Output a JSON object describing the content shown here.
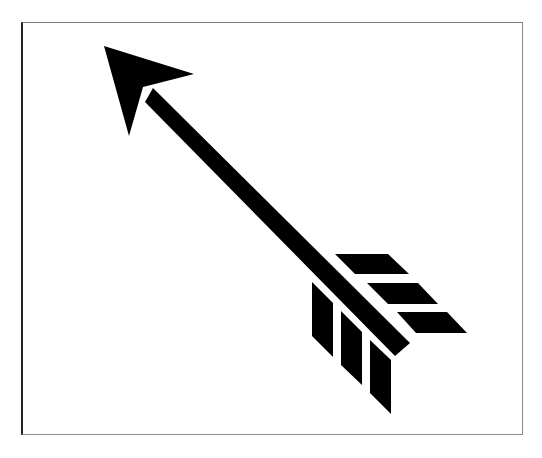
{
  "image": {
    "subject": "arrow",
    "description": "Black silhouette of an arrow pointing up-left with three-pronged fletching on each side",
    "background_color": "#ffffff",
    "fill_color": "#000000",
    "frame_color": "#7a7a7a"
  },
  "arrow": {
    "head": [
      [
        104,
        46
      ],
      [
        194,
        74
      ],
      [
        143,
        87
      ],
      [
        129,
        136
      ]
    ],
    "shaft": [
      [
        153,
        88
      ],
      [
        145,
        102
      ],
      [
        395,
        356
      ],
      [
        410,
        343
      ]
    ],
    "fletching_right": [
      [
        [
          335,
          254
        ],
        [
          388,
          254
        ],
        [
          409,
          274
        ],
        [
          355,
          274
        ]
      ],
      [
        [
          367,
          283
        ],
        [
          418,
          283
        ],
        [
          438,
          304
        ],
        [
          388,
          304
        ]
      ],
      [
        [
          397,
          312
        ],
        [
          447,
          312
        ],
        [
          467,
          333
        ],
        [
          416,
          333
        ]
      ]
    ],
    "fletching_left": [
      [
        [
          312,
          282
        ],
        [
          333,
          303
        ],
        [
          333,
          357
        ],
        [
          312,
          336
        ]
      ],
      [
        [
          341,
          311
        ],
        [
          362,
          332
        ],
        [
          362,
          385
        ],
        [
          341,
          365
        ]
      ],
      [
        [
          370,
          340
        ],
        [
          391,
          360
        ],
        [
          391,
          414
        ],
        [
          370,
          393
        ]
      ]
    ]
  }
}
